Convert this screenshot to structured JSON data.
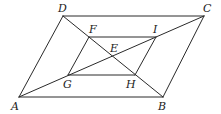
{
  "diagram": {
    "type": "geometry",
    "points": {
      "A": {
        "x": 19,
        "y": 97
      },
      "B": {
        "x": 163,
        "y": 97
      },
      "C": {
        "x": 204,
        "y": 16
      },
      "D": {
        "x": 63,
        "y": 16
      },
      "E": {
        "x": 112,
        "y": 57
      },
      "F": {
        "x": 89,
        "y": 37
      },
      "G": {
        "x": 68,
        "y": 75
      },
      "H": {
        "x": 135,
        "y": 75
      },
      "I": {
        "x": 156,
        "y": 37
      }
    },
    "labels": {
      "A": "A",
      "B": "B",
      "C": "C",
      "D": "D",
      "E": "E",
      "F": "F",
      "G": "G",
      "H": "H",
      "I": "I"
    },
    "segments": [
      [
        "A",
        "B"
      ],
      [
        "B",
        "C"
      ],
      [
        "C",
        "D"
      ],
      [
        "D",
        "A"
      ],
      [
        "A",
        "C"
      ],
      [
        "D",
        "B"
      ],
      [
        "F",
        "I"
      ],
      [
        "I",
        "H"
      ],
      [
        "H",
        "G"
      ],
      [
        "G",
        "F"
      ]
    ],
    "colors": {
      "line": "#2a2a2a",
      "text": "#222222",
      "background": "#ffffff"
    }
  }
}
